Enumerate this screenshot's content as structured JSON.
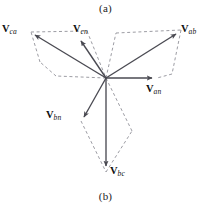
{
  "figure": {
    "caption_top": "(a)",
    "caption_bottom": "(b)",
    "origin": {
      "x": 106,
      "y": 78
    },
    "colors": {
      "solid_vector": "#4a4a52",
      "dashed_construction": "#8a8a92",
      "text": "#111111",
      "background": "#ffffff"
    },
    "vectors": [
      {
        "name": "V_an",
        "symbol": "V",
        "subscript": "an",
        "angle_deg": 0,
        "tip": {
          "x": 157,
          "y": 78
        },
        "label_pos": {
          "x": 147,
          "y": 84
        },
        "type": "line-to-neutral"
      },
      {
        "name": "V_bn",
        "symbol": "V",
        "subscript": "bn",
        "angle_deg": -120,
        "tip": {
          "x": 81,
          "y": 121
        },
        "label_pos": {
          "x": 47,
          "y": 110
        },
        "type": "line-to-neutral"
      },
      {
        "name": "V_cn",
        "symbol": "V",
        "subscript": "cn",
        "angle_deg": 120,
        "tip": {
          "x": 79,
          "y": 37
        },
        "label_pos": {
          "x": 74,
          "y": 24
        },
        "type": "line-to-neutral"
      },
      {
        "name": "V_ab",
        "symbol": "V",
        "subscript": "ab",
        "angle_deg": 30,
        "tip": {
          "x": 181,
          "y": 30
        },
        "label_pos": {
          "x": 181,
          "y": 24
        },
        "type": "line-to-line"
      },
      {
        "name": "V_bc",
        "symbol": "V",
        "subscript": "bc",
        "angle_deg": -90,
        "tip": {
          "x": 106,
          "y": 172
        },
        "label_pos": {
          "x": 110,
          "y": 166
        },
        "type": "line-to-line"
      },
      {
        "name": "V_ca",
        "symbol": "V",
        "subscript": "ca",
        "angle_deg": 150,
        "tip": {
          "x": 31,
          "y": 32
        },
        "label_pos": {
          "x": 2,
          "y": 24
        },
        "type": "line-to-line"
      }
    ],
    "construction_paths": [
      {
        "name": "parallelogram-ab",
        "points": [
          [
            106,
            78
          ],
          [
            116,
            33
          ],
          [
            181,
            30
          ],
          [
            172,
            74
          ],
          [
            106,
            78
          ]
        ]
      },
      {
        "name": "parallelogram-bc",
        "points": [
          [
            106,
            78
          ],
          [
            81,
            121
          ],
          [
            106,
            172
          ],
          [
            132,
            131
          ],
          [
            106,
            78
          ]
        ]
      },
      {
        "name": "parallelogram-ca",
        "points": [
          [
            106,
            78
          ],
          [
            31,
            32
          ],
          [
            40,
            62
          ],
          [
            56,
            76
          ],
          [
            106,
            78
          ]
        ]
      }
    ]
  }
}
